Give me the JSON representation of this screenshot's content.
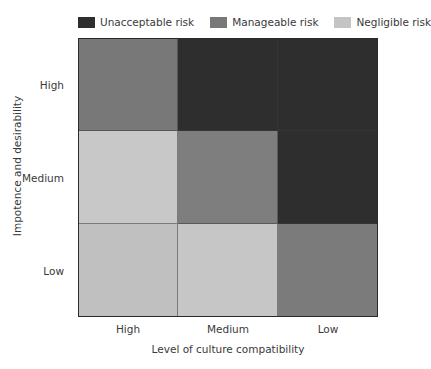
{
  "legend": {
    "items": [
      {
        "label": "Unacceptable risk",
        "color": "#2e2e2e",
        "key": "unacceptable"
      },
      {
        "label": "Manageable risk",
        "color": "#787878",
        "key": "manageable"
      },
      {
        "label": "Negligible risk",
        "color": "#c4c4c4",
        "key": "negligible"
      }
    ]
  },
  "chart_data": {
    "type": "heatmap",
    "title": "",
    "xlabel": "Level of culture compatibility",
    "ylabel": "Impotence and desirability",
    "x_categories": [
      "High",
      "Medium",
      "Low"
    ],
    "y_categories": [
      "High",
      "Medium",
      "Low"
    ],
    "legend_position": "top",
    "grid": true,
    "value_labels": [
      "Negligible risk",
      "Manageable risk",
      "Unacceptable risk"
    ],
    "colors": {
      "negligible": "#c4c4c4",
      "manageable": "#787878",
      "unacceptable": "#2e2e2e"
    },
    "cells": [
      {
        "row": "High",
        "col": "High",
        "value": "manageable",
        "color": "#787878"
      },
      {
        "row": "High",
        "col": "Medium",
        "value": "unacceptable",
        "color": "#2e2e2e"
      },
      {
        "row": "High",
        "col": "Low",
        "value": "unacceptable",
        "color": "#2e2e2e"
      },
      {
        "row": "Medium",
        "col": "High",
        "value": "negligible",
        "color": "#c8c8c8"
      },
      {
        "row": "Medium",
        "col": "Medium",
        "value": "manageable",
        "color": "#7e7e7e"
      },
      {
        "row": "Medium",
        "col": "Low",
        "value": "unacceptable",
        "color": "#2e2e2e"
      },
      {
        "row": "Low",
        "col": "High",
        "value": "negligible",
        "color": "#c0c0c0"
      },
      {
        "row": "Low",
        "col": "Medium",
        "value": "negligible",
        "color": "#c6c6c6"
      },
      {
        "row": "Low",
        "col": "Low",
        "value": "manageable",
        "color": "#7b7b7b"
      }
    ]
  }
}
